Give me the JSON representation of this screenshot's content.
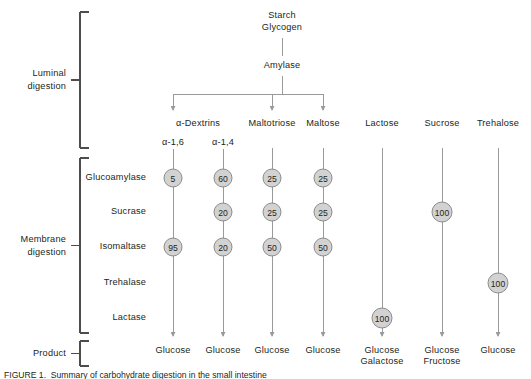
{
  "figure": {
    "caption": "FIGURE 1.  Summary of carbohydrate digestion in the small intestine"
  },
  "colors": {
    "node_fill": "#d2d2d2",
    "node_stroke": "#8c8c8c",
    "line": "#9a9a9a",
    "bracket": "#4d4d4d",
    "text": "#231f20"
  },
  "stages": [
    {
      "id": "luminal",
      "label_line1": "Luminal",
      "label_line2": "digestion"
    },
    {
      "id": "membrane",
      "label_line1": "Membrane",
      "label_line2": "digestion"
    },
    {
      "id": "product",
      "label_line1": "Product",
      "label_line2": ""
    }
  ],
  "source": {
    "substrate_line1": "Starch",
    "substrate_line2": "Glycogen",
    "enzyme": "Amylase"
  },
  "enzyme_rows": [
    {
      "id": "glucoamylase",
      "label": "Glucoamylase"
    },
    {
      "id": "sucrase",
      "label": "Sucrase"
    },
    {
      "id": "isomaltase",
      "label": "Isomaltase"
    },
    {
      "id": "trehalase",
      "label": "Trehalase"
    },
    {
      "id": "lactase",
      "label": "Lactase"
    }
  ],
  "columns": [
    {
      "id": "alpha-dextrins-16",
      "header": "α-Dextrins",
      "header_shared": true,
      "sublabel": "α-1,6",
      "from_amylase": true,
      "values": {
        "glucoamylase": 5,
        "sucrase": null,
        "isomaltase": 95,
        "trehalase": null,
        "lactase": null
      },
      "product_line1": "Glucose",
      "product_line2": ""
    },
    {
      "id": "alpha-dextrins-14",
      "header": "",
      "header_shared": true,
      "sublabel": "α-1,4",
      "from_amylase": false,
      "values": {
        "glucoamylase": 60,
        "sucrase": 20,
        "isomaltase": 20,
        "trehalase": null,
        "lactase": null
      },
      "product_line1": "Glucose",
      "product_line2": ""
    },
    {
      "id": "maltotriose",
      "header": "Maltotriose",
      "header_shared": false,
      "sublabel": "",
      "from_amylase": true,
      "values": {
        "glucoamylase": 25,
        "sucrase": 25,
        "isomaltase": 50,
        "trehalase": null,
        "lactase": null
      },
      "product_line1": "Glucose",
      "product_line2": ""
    },
    {
      "id": "maltose",
      "header": "Maltose",
      "header_shared": false,
      "sublabel": "",
      "from_amylase": true,
      "values": {
        "glucoamylase": 25,
        "sucrase": 25,
        "isomaltase": 50,
        "trehalase": null,
        "lactase": null
      },
      "product_line1": "Glucose",
      "product_line2": ""
    },
    {
      "id": "lactose",
      "header": "Lactose",
      "header_shared": false,
      "sublabel": "",
      "from_amylase": false,
      "values": {
        "glucoamylase": null,
        "sucrase": null,
        "isomaltase": null,
        "trehalase": null,
        "lactase": 100
      },
      "product_line1": "Glucose",
      "product_line2": "Galactose"
    },
    {
      "id": "sucrose",
      "header": "Sucrose",
      "header_shared": false,
      "sublabel": "",
      "from_amylase": false,
      "values": {
        "glucoamylase": null,
        "sucrase": 100,
        "isomaltase": null,
        "trehalase": null,
        "lactase": null
      },
      "product_line1": "Glucose",
      "product_line2": "Fructose"
    },
    {
      "id": "trehalose",
      "header": "Trehalose",
      "header_shared": false,
      "sublabel": "",
      "from_amylase": false,
      "values": {
        "glucoamylase": null,
        "sucrase": null,
        "isomaltase": null,
        "trehalase": 100,
        "lactase": null
      },
      "product_line1": "Glucose",
      "product_line2": ""
    }
  ]
}
